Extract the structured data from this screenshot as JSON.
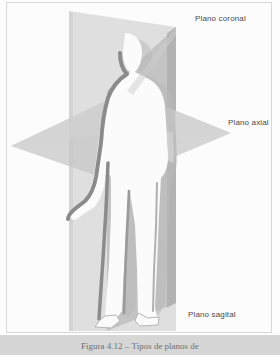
{
  "figure": {
    "background_color": "#fcfcfc",
    "frame_color": "#d8d8d8"
  },
  "labels": {
    "coronal": "Plano coronal",
    "axial": "Plano axial",
    "sagital": "Plano sagital",
    "text_color": "#4a4a4a"
  },
  "caption": {
    "text": "Figura 4.12 – Tipos de planos de",
    "band_color": "#d6d6d6",
    "text_color": "#6f6f6f"
  },
  "planes": {
    "coronal": {
      "name": "Plano coronal",
      "orientation": "vertical-frontal",
      "fill": "#d9d9d9",
      "opacity": 0.85
    },
    "axial": {
      "name": "Plano axial",
      "orientation": "horizontal-transverse",
      "fill": "#c9c9c9",
      "opacity": 0.8
    },
    "sagital": {
      "name": "Plano sagital",
      "orientation": "vertical-lateral",
      "fill": "#b4b4b4",
      "opacity": 0.85
    }
  },
  "body_figure": {
    "name": "human-silhouette",
    "fill": "#fbfbfb",
    "outline": "#8a8a8a",
    "shadow": "#bdbdbd"
  }
}
